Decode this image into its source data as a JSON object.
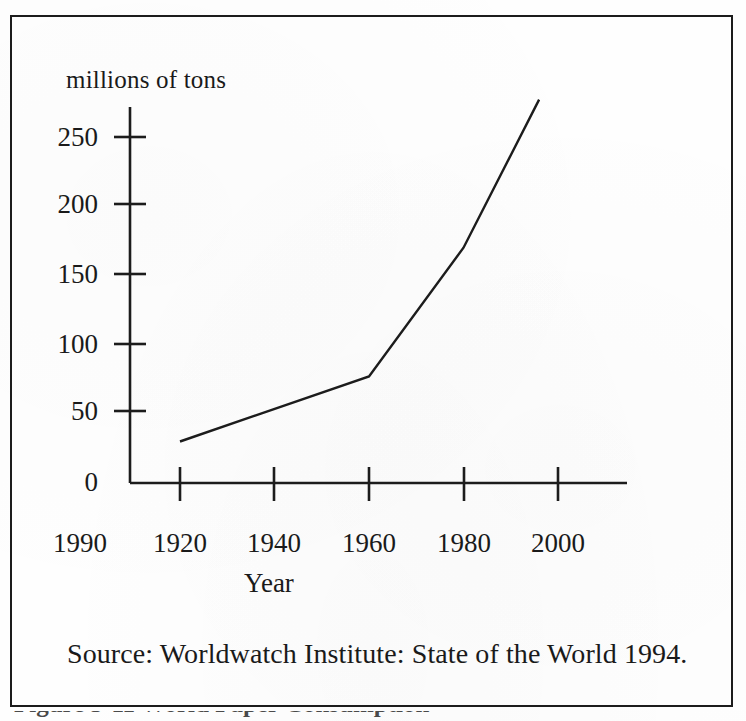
{
  "figure": {
    "y_axis_caption": "millions of tons",
    "x_axis_title": "Year",
    "source_note": "Source:  Worldwatch Institute:  State of the World 1994.",
    "bottom_caption": "Figure 3-11   World Paper Consumption",
    "ink_color": "#1c1c1c",
    "paper_color": "#fefefe"
  },
  "chart_data": {
    "type": "line",
    "title": "",
    "subtitle": "",
    "xlabel": "Year",
    "ylabel": "millions of tons",
    "xlim": [
      1900,
      2000
    ],
    "ylim": [
      0,
      285
    ],
    "grid": false,
    "legend": "none",
    "x_tick_labels": [
      "1990",
      "1920",
      "1940",
      "1960",
      "1980",
      "2000"
    ],
    "x_tick_values": [
      1900,
      1920,
      1940,
      1960,
      1980,
      2000
    ],
    "y_tick_labels": [
      "0",
      "50",
      "100",
      "150",
      "200",
      "250"
    ],
    "y_tick_values": [
      0,
      50,
      100,
      150,
      200,
      250
    ],
    "series": [
      {
        "name": "World paper consumption",
        "x": [
          1920,
          1960,
          1980,
          1996
        ],
        "values": [
          30,
          77,
          170,
          277
        ]
      }
    ],
    "annotations": []
  }
}
